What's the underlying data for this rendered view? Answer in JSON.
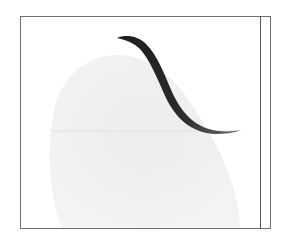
{
  "illustration": {
    "description": "Framed line illustration with a dark tapered S-curve brush stroke over a faint grey rounded shadow shape",
    "colors": {
      "background": "#ffffff",
      "frame": "#6e6e6e",
      "inner_rule": "#5a5a5a",
      "stroke": "#2a2a2a",
      "stroke_tail": "#4a4a4a",
      "shadow_blob": "#efefef",
      "faint_rule": "#e2e2e2"
    }
  }
}
